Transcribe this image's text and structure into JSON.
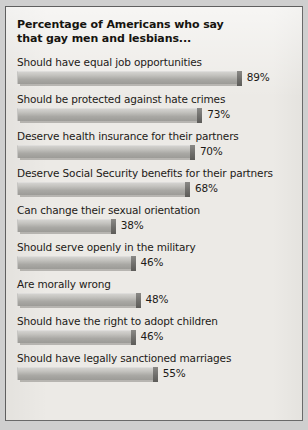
{
  "chart_data": {
    "type": "bar",
    "orientation": "horizontal",
    "title": "Percentage of Americans who say\nthat gay men and lesbians...",
    "xlabel": "",
    "ylabel": "",
    "xlim": [
      0,
      100
    ],
    "grid": false,
    "legend": false,
    "value_suffix": "%",
    "categories": [
      "Should have equal job opportunities",
      "Should be protected against hate crimes",
      "Deserve health insurance for their partners",
      "Deserve Social Security benefits for their partners",
      "Can change their sexual orientation",
      "Should serve openly in the military",
      "Are morally wrong",
      "Should have the right to adopt children",
      "Should have legally sanctioned marriages"
    ],
    "values": [
      89,
      73,
      70,
      68,
      38,
      46,
      48,
      46,
      55
    ],
    "value_labels": [
      "89%",
      "73%",
      "70%",
      "68%",
      "38%",
      "46%",
      "48%",
      "46%",
      "55%"
    ],
    "bars": [
      {
        "label": "Should have equal job opportunities",
        "value": 89,
        "value_label": "89%"
      },
      {
        "label": "Should be protected against hate crimes",
        "value": 73,
        "value_label": "73%"
      },
      {
        "label": "Deserve health insurance for their partners",
        "value": 70,
        "value_label": "70%"
      },
      {
        "label": "Deserve Social Security benefits for their partners",
        "value": 68,
        "value_label": "68%"
      },
      {
        "label": "Can change their sexual orientation",
        "value": 38,
        "value_label": "38%"
      },
      {
        "label": "Should serve openly in the military",
        "value": 46,
        "value_label": "46%"
      },
      {
        "label": "Are morally wrong",
        "value": 48,
        "value_label": "48%"
      },
      {
        "label": "Should have the right to adopt children",
        "value": 46,
        "value_label": "46%"
      },
      {
        "label": "Should have legally sanctioned marriages",
        "value": 55,
        "value_label": "55%"
      }
    ]
  },
  "style": {
    "panel_background": "#eceae6",
    "panel_border": "#5f5f5f",
    "page_background": "#cfcfcf",
    "bar_fill_top": "#d3d2cf",
    "bar_fill_bottom": "#9c9b97",
    "bar_cap": "#6f6e6b",
    "text_color": "#1d1a17",
    "title_color": "#16140f"
  },
  "scale": {
    "px_per_percent": 2.47,
    "bar_origin_x_px": 20
  }
}
